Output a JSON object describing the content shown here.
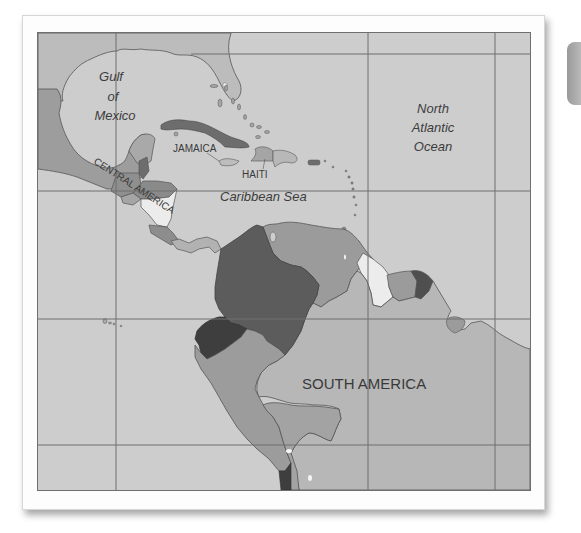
{
  "map": {
    "type": "political-region-map",
    "region": "Caribbean, Central America and northern South America",
    "colors": {
      "ocean": "#cdcdcd",
      "land_light": "#b9b9b9",
      "land_medium": "#9b9b9b",
      "land_dark": "#6d6d6d",
      "land_darkest": "#4a4a4a",
      "land_white": "#ececec",
      "gridline": "#6e6e6e",
      "label_text": "#3c3c3c"
    },
    "labels": {
      "water": [
        {
          "id": "gulf-of-mexico",
          "lines": [
            "Gulf",
            "of",
            "Mexico"
          ]
        },
        {
          "id": "north-atlantic-ocean",
          "lines": [
            "North",
            "Atlantic",
            "Ocean"
          ]
        },
        {
          "id": "caribbean-sea",
          "text": "Caribbean Sea"
        }
      ],
      "places": {
        "jamaica": "JAMAICA",
        "haiti": "HAITI",
        "central_america": "CENTRAL AMERICA",
        "south_america": "SOUTH AMERICA"
      }
    },
    "gridlines": {
      "vertical_x": [
        115,
        367,
        494
      ],
      "horizontal_y": [
        53,
        190,
        318,
        444
      ]
    }
  }
}
